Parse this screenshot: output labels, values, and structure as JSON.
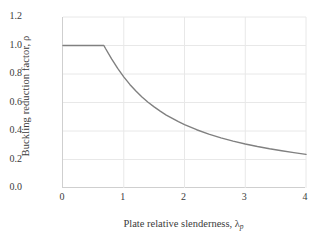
{
  "chart_data": {
    "type": "line",
    "title": "",
    "xlabel": "Plate relative slenderness, λ",
    "xlabel_sub": "p",
    "ylabel": "Buckling reduction factor, ρ",
    "xlim": [
      0,
      4
    ],
    "ylim": [
      0.0,
      1.2
    ],
    "xticks": [
      "0",
      "1",
      "2",
      "3",
      "4"
    ],
    "xtick_values": [
      0,
      1,
      2,
      3,
      4
    ],
    "yticks": [
      "0.0",
      "0.2",
      "0.4",
      "0.6",
      "0.8",
      "1.0",
      "1.2"
    ],
    "ytick_values": [
      0.0,
      0.2,
      0.4,
      0.6,
      0.8,
      1.0,
      1.2
    ],
    "grid": true,
    "legend": "none",
    "line_color": "#808080",
    "grid_color": "#e8e8e8",
    "axis_color": "#cfcfcf",
    "series": [
      {
        "name": "Winter buckling reduction curve",
        "plateau_limit": 0.673,
        "plateau_value": 1.0,
        "x": [
          0.0,
          0.1,
          0.2,
          0.3,
          0.4,
          0.5,
          0.6,
          0.673,
          0.7,
          0.8,
          0.9,
          1.0,
          1.1,
          1.2,
          1.3,
          1.4,
          1.5,
          1.6,
          1.7,
          1.8,
          1.9,
          2.0,
          2.2,
          2.4,
          2.6,
          2.8,
          3.0,
          3.2,
          3.4,
          3.6,
          3.8,
          4.0
        ],
        "values": [
          1.0,
          1.0,
          1.0,
          1.0,
          1.0,
          1.0,
          1.0,
          1.0,
          0.979,
          0.906,
          0.839,
          0.78,
          0.727,
          0.681,
          0.639,
          0.602,
          0.569,
          0.539,
          0.512,
          0.488,
          0.465,
          0.445,
          0.409,
          0.378,
          0.352,
          0.329,
          0.309,
          0.291,
          0.275,
          0.261,
          0.248,
          0.236
        ]
      }
    ]
  }
}
